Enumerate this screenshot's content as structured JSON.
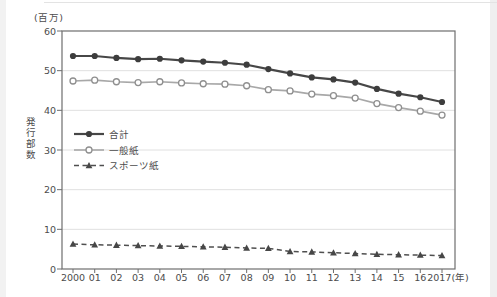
{
  "chart_data": {
    "type": "line",
    "title": "",
    "unit_label": "(百万)",
    "ylabel": "発行部数",
    "ylim": [
      0,
      60
    ],
    "yticks": [
      0,
      10,
      20,
      30,
      40,
      50,
      60
    ],
    "grid": "horizontal",
    "legend_position": "inside-left",
    "x_labels": [
      "2000",
      "01",
      "02",
      "03",
      "04",
      "05",
      "06",
      "07",
      "08",
      "09",
      "10",
      "11",
      "12",
      "13",
      "14",
      "15",
      "16",
      "2017(年)"
    ],
    "series": [
      {
        "name": "合計",
        "style": "solid",
        "marker": "filled-circle",
        "line_color": "#474747",
        "marker_color": "#3d3d3d",
        "values": [
          53.7,
          53.7,
          53.2,
          52.9,
          53.0,
          52.6,
          52.3,
          52.0,
          51.5,
          50.4,
          49.3,
          48.3,
          47.8,
          47.0,
          45.4,
          44.2,
          43.3,
          42.1
        ]
      },
      {
        "name": "一般紙",
        "style": "solid",
        "marker": "open-circle",
        "line_color": "#a8a8a8",
        "marker_color": "#8f8f8f",
        "values": [
          47.4,
          47.6,
          47.2,
          47.0,
          47.2,
          46.9,
          46.7,
          46.6,
          46.2,
          45.2,
          44.9,
          44.1,
          43.7,
          43.1,
          41.7,
          40.7,
          39.8,
          38.8
        ]
      },
      {
        "name": "スポーツ紙",
        "style": "dashed",
        "marker": "filled-triangle",
        "line_color": "#4f4f4f",
        "marker_color": "#474747",
        "values": [
          6.3,
          6.1,
          6.0,
          5.9,
          5.8,
          5.7,
          5.6,
          5.5,
          5.3,
          5.2,
          4.4,
          4.3,
          4.1,
          3.9,
          3.7,
          3.6,
          3.5,
          3.4
        ]
      }
    ],
    "axis_color": "#6e6e6e",
    "grid_color": "#e0e0e0",
    "text_color": "#4c4c4c",
    "background_color": "#ffffff"
  }
}
